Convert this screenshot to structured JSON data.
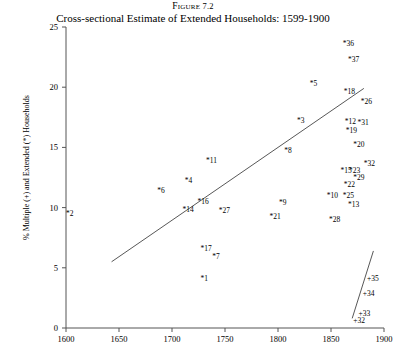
{
  "figure": {
    "label_prefix": "Figure",
    "label_number": "7.2",
    "title": "Cross-sectional Estimate of Extended Households: 1599-1900"
  },
  "axes": {
    "ylabel": "% Multiple (+) and Extended (*) Households",
    "xlabel": "",
    "yticks": [
      "0",
      "5",
      "10",
      "15",
      "20",
      "25"
    ],
    "xticks": [
      "1600",
      "1650",
      "1700",
      "1750",
      "1800",
      "1850",
      "1900"
    ]
  },
  "chart_data": {
    "type": "scatter",
    "title": "Cross-sectional Estimate of Extended Households: 1599-1900",
    "xlabel": "",
    "ylabel": "% Multiple (+) and Extended (*) Households",
    "xlim": [
      1600,
      1900
    ],
    "ylim": [
      0,
      25
    ],
    "grid": false,
    "legend": "none",
    "marker_note": "Labels prefixed with * denote Extended households; labels prefixed with + denote Multiple households",
    "series": [
      {
        "name": "Extended (*) Households",
        "marker": "*",
        "points": [
          {
            "label": "36",
            "x": 1861,
            "y": 23.6
          },
          {
            "label": "37",
            "x": 1866,
            "y": 22.3
          },
          {
            "label": "5",
            "x": 1830,
            "y": 20.3
          },
          {
            "label": "18",
            "x": 1862,
            "y": 19.6
          },
          {
            "label": "26",
            "x": 1878,
            "y": 18.8
          },
          {
            "label": "3",
            "x": 1818,
            "y": 17.2
          },
          {
            "label": "12",
            "x": 1863,
            "y": 17.1
          },
          {
            "label": "31",
            "x": 1875,
            "y": 17.0
          },
          {
            "label": "19",
            "x": 1864,
            "y": 16.4
          },
          {
            "label": "20",
            "x": 1871,
            "y": 15.2
          },
          {
            "label": "8",
            "x": 1806,
            "y": 14.7
          },
          {
            "label": "11",
            "x": 1732,
            "y": 13.9
          },
          {
            "label": "32",
            "x": 1881,
            "y": 13.6
          },
          {
            "label": "15",
            "x": 1859,
            "y": 13.0
          },
          {
            "label": "23",
            "x": 1867,
            "y": 13.0
          },
          {
            "label": "29",
            "x": 1871,
            "y": 12.5
          },
          {
            "label": "4",
            "x": 1712,
            "y": 12.2
          },
          {
            "label": "22",
            "x": 1862,
            "y": 11.9
          },
          {
            "label": "6",
            "x": 1686,
            "y": 11.4
          },
          {
            "label": "10",
            "x": 1846,
            "y": 11.0
          },
          {
            "label": "25",
            "x": 1861,
            "y": 11.0
          },
          {
            "label": "16",
            "x": 1724,
            "y": 10.5
          },
          {
            "label": "9",
            "x": 1801,
            "y": 10.4
          },
          {
            "label": "13",
            "x": 1866,
            "y": 10.2
          },
          {
            "label": "14",
            "x": 1710,
            "y": 9.8
          },
          {
            "label": "27",
            "x": 1744,
            "y": 9.7
          },
          {
            "label": "2",
            "x": 1600,
            "y": 9.5
          },
          {
            "label": "21",
            "x": 1792,
            "y": 9.2
          },
          {
            "label": "28",
            "x": 1848,
            "y": 9.0
          },
          {
            "label": "17",
            "x": 1727,
            "y": 6.6
          },
          {
            "label": "7",
            "x": 1738,
            "y": 5.9
          },
          {
            "label": "1",
            "x": 1727,
            "y": 4.1
          }
        ]
      },
      {
        "name": "Multiple (+) Households",
        "marker": "+",
        "points": [
          {
            "label": "35",
            "x": 1884,
            "y": 4.1
          },
          {
            "label": "34",
            "x": 1880,
            "y": 2.8
          },
          {
            "label": "33",
            "x": 1876,
            "y": 1.2
          },
          {
            "label": "32",
            "x": 1871,
            "y": 0.6
          }
        ]
      }
    ],
    "trend_lines": [
      {
        "name": "extended-trend-line",
        "x_start": 1643,
        "y_start": 5.5,
        "x_end": 1881,
        "y_end": 19.9
      },
      {
        "name": "multiple-trend-line",
        "x_start": 1870,
        "y_start": 0.8,
        "x_end": 1890,
        "y_end": 6.4
      }
    ]
  }
}
